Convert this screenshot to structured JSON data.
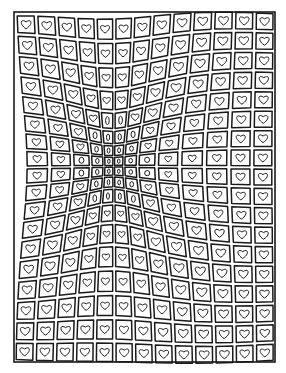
{
  "artwork": {
    "title": "Warped heart grid drawing",
    "description": "Hand-drawn op-art grid of rounded squares each containing a heart; the grid bulges/recedes toward a vanishing area left of center where hearts shrink into ovals.",
    "frame": {
      "x": 14,
      "y": 12,
      "width": 261,
      "height": 350
    },
    "grid": {
      "cols": 13,
      "rows": 18
    },
    "focus": {
      "x": 0.38,
      "y": 0.44
    },
    "colors": {
      "ink": "#1a1a1a",
      "paper": "#ffffff"
    }
  }
}
